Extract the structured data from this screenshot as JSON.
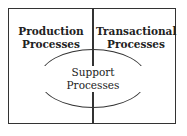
{
  "diagram": {
    "left_region": {
      "line1": "Production",
      "line2": "Processes"
    },
    "right_region": {
      "line1": "Transactional",
      "line2": "Processes"
    },
    "center_ellipse": {
      "line1": "Support",
      "line2": "Processes"
    }
  }
}
